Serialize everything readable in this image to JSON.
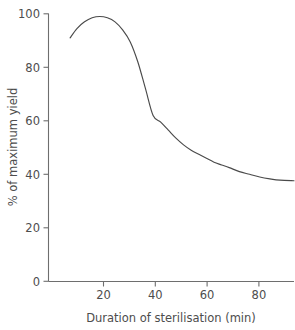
{
  "chart_data": {
    "type": "line",
    "title": "",
    "xlabel": "Duration of sterilisation (min)",
    "ylabel": "% of maximum yield",
    "xlim": [
      -1.2,
      95.5
    ],
    "ylim": [
      0,
      100
    ],
    "grid": false,
    "legend": null,
    "xticks": [
      20,
      40,
      60,
      80
    ],
    "xtick_labels": [
      "20",
      "40",
      "60",
      "80"
    ],
    "yticks": [
      0,
      20,
      40,
      60,
      80,
      100
    ],
    "ytick_labels": [
      "0",
      "20",
      "40",
      "60",
      "80",
      "100"
    ],
    "series": [
      {
        "name": "yield",
        "x": [
          7.3,
          10,
          13,
          16,
          19,
          22,
          25,
          28,
          31,
          34,
          37,
          40,
          43,
          46,
          49,
          52,
          55,
          58,
          61,
          64,
          67,
          70,
          74,
          78,
          82,
          86,
          90,
          95.5
        ],
        "values": [
          91,
          94.5,
          97,
          98.5,
          99,
          98.5,
          97,
          94,
          89.5,
          82,
          72,
          62,
          59.5,
          56.5,
          53.5,
          51,
          49,
          47.5,
          46,
          44.5,
          43.5,
          42.5,
          41,
          40,
          39,
          38.3,
          37.8,
          37.6
        ]
      }
    ],
    "annotations": []
  }
}
